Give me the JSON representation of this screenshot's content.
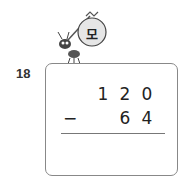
{
  "problem": {
    "number": "18",
    "label_char": "모",
    "operator": "−",
    "minuend_digits": [
      "1",
      "2",
      "0"
    ],
    "subtrahend_digits": [
      "6",
      "4"
    ]
  }
}
